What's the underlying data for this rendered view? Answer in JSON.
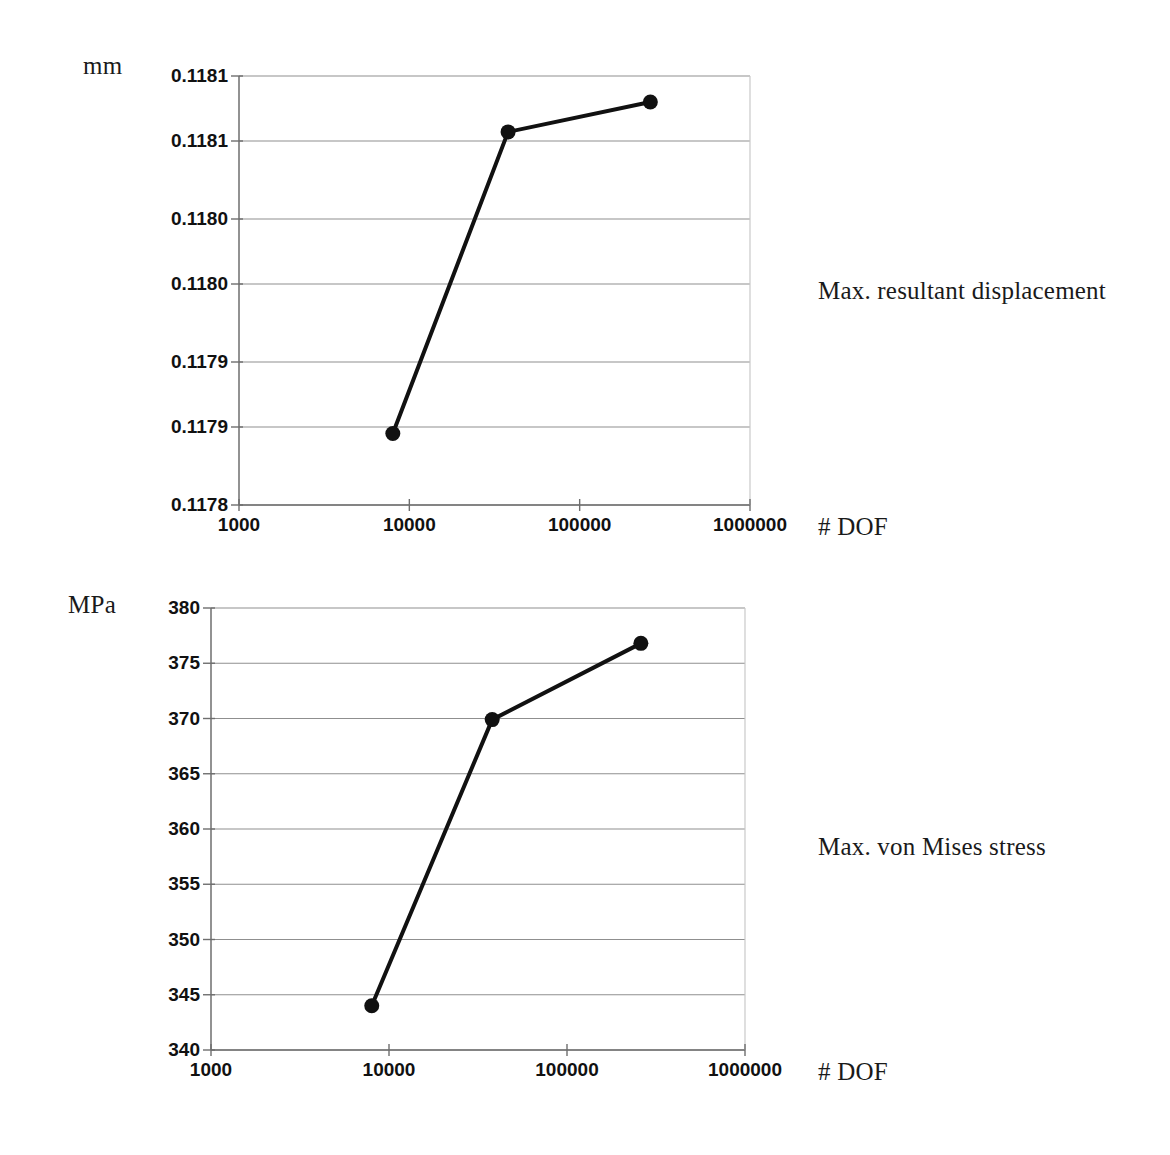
{
  "figure": {
    "background_color": "#ffffff",
    "ink_color": "#111111",
    "grid_color": "#8f8f8f",
    "axis_color": "#6e6e6e"
  },
  "panels": [
    {
      "id": "displacement-panel",
      "y_unit_label": "mm",
      "x_axis_title": "# DOF",
      "annotation": "Max. resultant displacement",
      "y_tick_labels": [
        "0.1181",
        "0.1181",
        "0.1180",
        "0.1180",
        "0.1179",
        "0.1179",
        "0.1178"
      ],
      "x_tick_labels": [
        "1000",
        "10000",
        "100000",
        "1000000"
      ]
    },
    {
      "id": "stress-panel",
      "y_unit_label": "MPa",
      "x_axis_title": "# DOF",
      "annotation": "Max. von Mises stress",
      "y_tick_labels": [
        "380",
        "375",
        "370",
        "365",
        "360",
        "355",
        "350",
        "345",
        "340"
      ],
      "x_tick_labels": [
        "1000",
        "10000",
        "100000",
        "1000000"
      ]
    }
  ],
  "chart_data": [
    {
      "type": "line",
      "title": "Max. resultant displacement",
      "xlabel": "# DOF",
      "ylabel": "mm",
      "xscale": "log",
      "xlim": [
        1000,
        1000000
      ],
      "ylim": [
        0.1178,
        0.11813
      ],
      "xticks": [
        1000,
        10000,
        100000,
        1000000
      ],
      "xtick_labels": [
        "1000",
        "10000",
        "100000",
        "1000000"
      ],
      "yticks": [
        0.11813,
        0.11808,
        0.11802,
        0.11797,
        0.11791,
        0.11786,
        0.1178
      ],
      "ytick_labels": [
        "0.1181",
        "0.1181",
        "0.1180",
        "0.1180",
        "0.1179",
        "0.1179",
        "0.1178"
      ],
      "grid": true,
      "legend": false,
      "series": [
        {
          "name": "Max. resultant displacement",
          "marker": "filled-circle",
          "x": [
            8000,
            38000,
            260000
          ],
          "y": [
            0.117855,
            0.118087,
            0.11811
          ]
        }
      ]
    },
    {
      "type": "line",
      "title": "Max. von Mises stress",
      "xlabel": "# DOF",
      "ylabel": "MPa",
      "xscale": "log",
      "xlim": [
        1000,
        1000000
      ],
      "ylim": [
        340,
        380
      ],
      "xticks": [
        1000,
        10000,
        100000,
        1000000
      ],
      "xtick_labels": [
        "1000",
        "10000",
        "100000",
        "1000000"
      ],
      "yticks": [
        380,
        375,
        370,
        365,
        360,
        355,
        350,
        345,
        340
      ],
      "ytick_labels": [
        "380",
        "375",
        "370",
        "365",
        "360",
        "355",
        "350",
        "345",
        "340"
      ],
      "grid": true,
      "legend": false,
      "series": [
        {
          "name": "Max. von Mises stress",
          "marker": "filled-circle",
          "x": [
            8000,
            38000,
            260000
          ],
          "y": [
            344.0,
            369.9,
            376.8
          ]
        }
      ]
    }
  ]
}
